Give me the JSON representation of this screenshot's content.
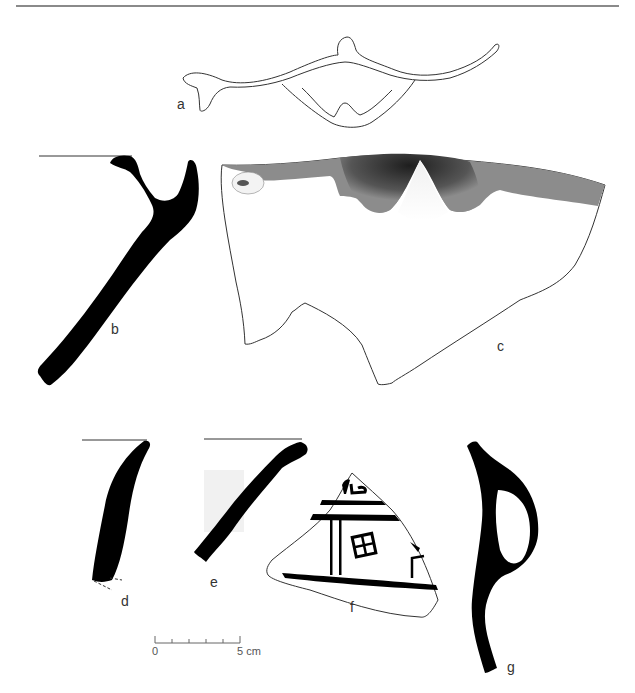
{
  "figure": {
    "labels": {
      "a": "a",
      "b": "b",
      "c": "c",
      "d": "d",
      "e": "e",
      "f": "f",
      "g": "g"
    },
    "scale_bar": {
      "start": "0",
      "end": "5 cm",
      "ticks": 5
    },
    "colors": {
      "ink": "#000000",
      "outline": "#333333",
      "shade": "#8c8c8c",
      "rule": "#8a8a8a"
    }
  }
}
